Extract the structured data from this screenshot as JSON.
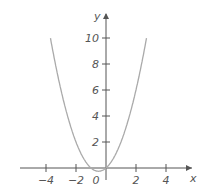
{
  "chart_data": {
    "type": "line",
    "title": "",
    "xlabel": "x",
    "ylabel": "y",
    "function": "y = x^2 + x",
    "xlim": [
      -5.5,
      5.5
    ],
    "ylim": [
      -0.5,
      11
    ],
    "x_ticks": [
      -4,
      -2,
      0,
      2,
      4
    ],
    "x_tick_labels": [
      "−4",
      "−2",
      "0",
      "2",
      "4"
    ],
    "y_ticks": [
      2,
      4,
      6,
      8,
      10
    ],
    "y_tick_labels": [
      "2",
      "4",
      "6",
      "8",
      "10"
    ],
    "grid": false,
    "series": [
      {
        "name": "y = x² + x",
        "x": [
          -3.7,
          -3,
          -2,
          -1,
          -0.5,
          0,
          1,
          2,
          2.7
        ],
        "y": [
          10,
          6,
          2,
          0,
          -0.25,
          0,
          2,
          6,
          10
        ]
      }
    ],
    "curve_color": "#aaaaaa",
    "axis_color": "#555555"
  }
}
